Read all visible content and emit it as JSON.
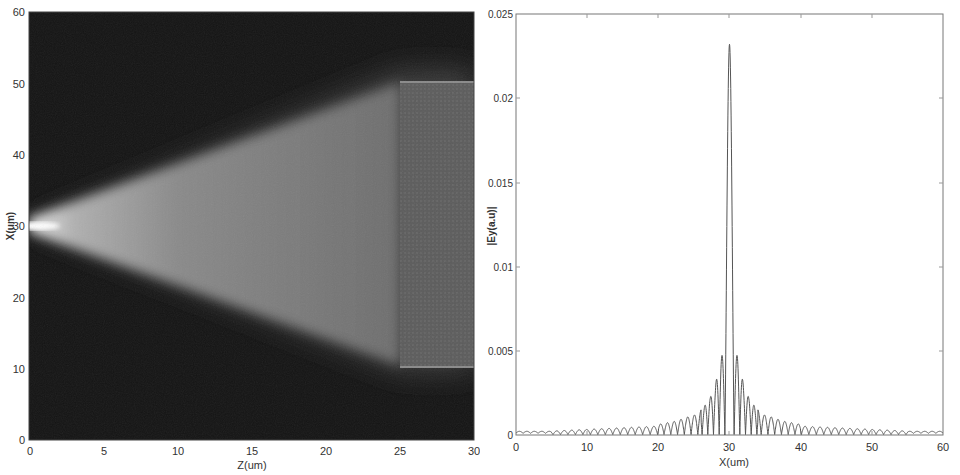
{
  "chart_data": [
    {
      "type": "heatmap",
      "title": "",
      "xlabel": "Z(um)",
      "ylabel": "X(um)",
      "xlim": [
        0,
        30
      ],
      "ylim": [
        0,
        60
      ],
      "xticks": [
        0,
        5,
        10,
        15,
        20,
        25,
        30
      ],
      "yticks": [
        0,
        10,
        20,
        30,
        40,
        50,
        60
      ],
      "colormap": "gray",
      "grid": false,
      "description": "Field intensity: narrow bright beam at X=30 from Z=0, spreading linearly as a cone to cover X≈10–50 at Z=25, then uniform region (waveguide) from Z=25 to Z=30 spanning X≈10.5–50.5",
      "beam": {
        "source_x": 30,
        "source_z": 0,
        "cone_end_z": 25,
        "cone_upper_x_at_end": 50,
        "cone_lower_x_at_end": 10.5,
        "guide_region": {
          "z_start": 25,
          "z_end": 30,
          "x_min": 10.5,
          "x_max": 50.5
        }
      }
    },
    {
      "type": "line",
      "title": "",
      "xlabel": "X(um)",
      "ylabel": "|Ey(a.u)|",
      "xlim": [
        0,
        60
      ],
      "ylim": [
        0,
        0.025
      ],
      "xticks": [
        0,
        10,
        20,
        30,
        40,
        50,
        60
      ],
      "yticks": [
        0,
        0.005,
        0.01,
        0.015,
        0.02,
        0.025
      ],
      "ytick_labels": [
        "0",
        "0.005",
        "0.01",
        "0.015",
        "0.02",
        "0.025"
      ],
      "grid": false,
      "series": [
        {
          "name": "|Ey|",
          "peak": {
            "x": 30,
            "y": 0.0232
          },
          "sidelobes": [
            {
              "x": 28.8,
              "y": 0.0047
            },
            {
              "x": 31.2,
              "y": 0.0047
            },
            {
              "x": 28.0,
              "y": 0.0029
            },
            {
              "x": 32.0,
              "y": 0.0029
            },
            {
              "x": 27.3,
              "y": 0.0022
            },
            {
              "x": 32.8,
              "y": 0.0022
            },
            {
              "x": 26.5,
              "y": 0.0017
            },
            {
              "x": 33.6,
              "y": 0.0016
            },
            {
              "x": 25.5,
              "y": 0.0013
            },
            {
              "x": 34.5,
              "y": 0.0012
            },
            {
              "x": 24.5,
              "y": 0.0011
            },
            {
              "x": 35.5,
              "y": 0.0011
            },
            {
              "x": 22.5,
              "y": 0.0008
            },
            {
              "x": 37.5,
              "y": 0.0008
            },
            {
              "x": 20.0,
              "y": 0.0006
            },
            {
              "x": 40.0,
              "y": 0.0005
            },
            {
              "x": 15.0,
              "y": 0.0004
            },
            {
              "x": 45.0,
              "y": 0.0004
            },
            {
              "x": 10.0,
              "y": 0.0003
            },
            {
              "x": 50.0,
              "y": 0.0003
            },
            {
              "x": 5.0,
              "y": 0.0002
            },
            {
              "x": 55.0,
              "y": 0.0002
            }
          ],
          "baseline": 0.0001
        }
      ]
    }
  ]
}
